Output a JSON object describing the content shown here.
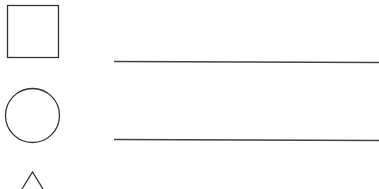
{
  "canvas": {
    "width": 379,
    "height": 189,
    "background": "#ffffff"
  },
  "stroke_color": "#333333",
  "rows": [
    {
      "shape": "square",
      "answer_line": ""
    },
    {
      "shape": "circle",
      "answer_line": ""
    },
    {
      "shape": "triangle",
      "answer_line": ""
    }
  ]
}
